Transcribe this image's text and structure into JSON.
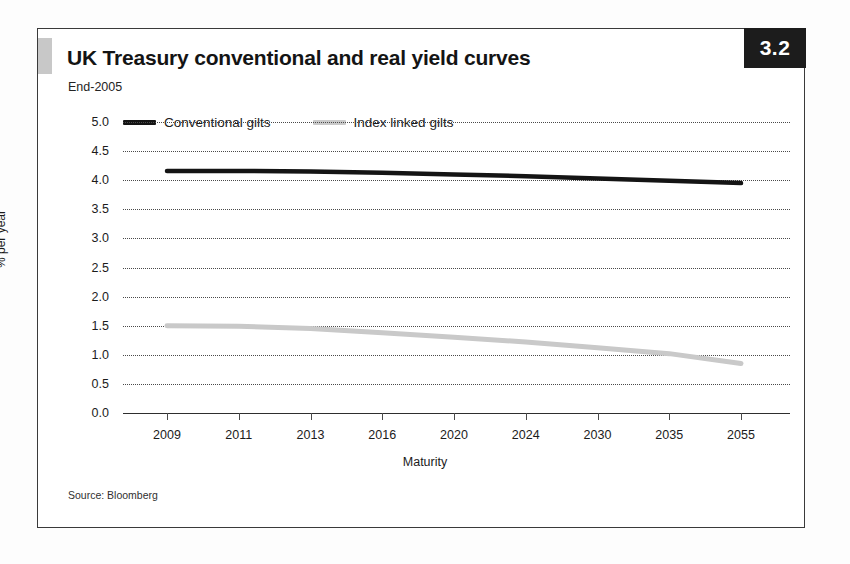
{
  "figure": {
    "number_badge": "3.2",
    "title": "UK Treasury conventional and real yield curves",
    "subtitle": "End-2005",
    "source_note": "Source: Bloomberg"
  },
  "colors": {
    "conventional": "#141414",
    "index_linked": "#c9c9c9",
    "gridline": "#4a4a4a",
    "frame": "#3a3a3a",
    "badge_background": "#1c1c1c",
    "badge_text": "#ffffff",
    "accent_square": "#c8c8c8"
  },
  "legend": {
    "position": "top-left-inside",
    "items": [
      {
        "label": "Conventional gilts",
        "color": "#141414"
      },
      {
        "label": "Index linked gilts",
        "color": "#c9c9c9"
      }
    ]
  },
  "chart_data": {
    "type": "line",
    "title": "UK Treasury conventional and real yield curves",
    "subtitle": "End-2005",
    "xlabel": "Maturity",
    "ylabel": "% per year",
    "categories": [
      "2009",
      "2011",
      "2013",
      "2016",
      "2020",
      "2024",
      "2030",
      "2035",
      "2055"
    ],
    "ylim": [
      0.0,
      5.0
    ],
    "yticks": [
      "0.0",
      "0.5",
      "1.0",
      "1.5",
      "2.0",
      "2.5",
      "3.0",
      "3.5",
      "4.0",
      "4.5",
      "5.0"
    ],
    "ytick_values": [
      0.0,
      0.5,
      1.0,
      1.5,
      2.0,
      2.5,
      3.0,
      3.5,
      4.0,
      4.5,
      5.0
    ],
    "grid": "horizontal-dotted",
    "legend_position": "top-left",
    "series": [
      {
        "name": "Conventional gilts",
        "color": "#141414",
        "values": [
          4.16,
          4.16,
          4.15,
          4.13,
          4.1,
          4.07,
          4.03,
          3.99,
          3.95
        ]
      },
      {
        "name": "Index linked gilts",
        "color": "#c9c9c9",
        "values": [
          1.5,
          1.49,
          1.45,
          1.38,
          1.3,
          1.22,
          1.12,
          1.02,
          0.85
        ]
      }
    ]
  }
}
